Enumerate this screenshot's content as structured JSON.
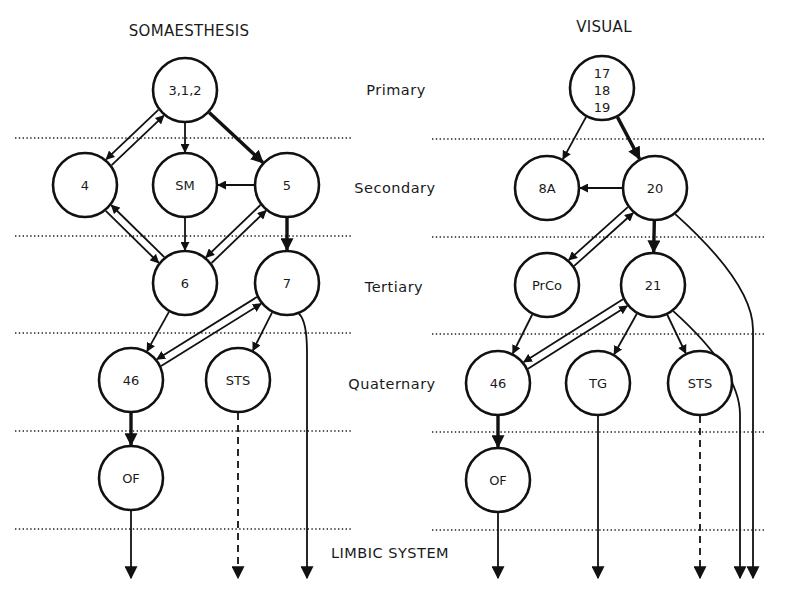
{
  "figure": {
    "levels": [
      {
        "id": "primary",
        "label": "Primary"
      },
      {
        "id": "secondary",
        "label": "Secondary"
      },
      {
        "id": "tertiary",
        "label": "Tertiary"
      },
      {
        "id": "quaternary",
        "label": "Quaternary"
      },
      {
        "id": "limbic",
        "label": "LIMBIC SYSTEM"
      }
    ],
    "panels": [
      {
        "id": "somaesthesis",
        "title": "SOMAESTHESIS",
        "nodes": [
          {
            "id": "s312",
            "label": "3,1,2",
            "level": "primary"
          },
          {
            "id": "s4",
            "label": "4",
            "level": "secondary"
          },
          {
            "id": "sSM",
            "label": "SM",
            "level": "secondary"
          },
          {
            "id": "s5",
            "label": "5",
            "level": "secondary"
          },
          {
            "id": "s6",
            "label": "6",
            "level": "tertiary"
          },
          {
            "id": "s7",
            "label": "7",
            "level": "tertiary"
          },
          {
            "id": "s46",
            "label": "46",
            "level": "quaternary"
          },
          {
            "id": "sSTS",
            "label": "STS",
            "level": "quaternary"
          },
          {
            "id": "sOF",
            "label": "OF",
            "level": "quaternary-limbic"
          }
        ],
        "edges": [
          {
            "from": "s312",
            "to": "s4",
            "type": "reciprocal"
          },
          {
            "from": "s312",
            "to": "sSM",
            "type": "normal"
          },
          {
            "from": "s312",
            "to": "s5",
            "type": "thick"
          },
          {
            "from": "s5",
            "to": "sSM",
            "type": "normal"
          },
          {
            "from": "s4",
            "to": "s6",
            "type": "reciprocal"
          },
          {
            "from": "sSM",
            "to": "s6",
            "type": "normal"
          },
          {
            "from": "s5",
            "to": "s6",
            "type": "reciprocal"
          },
          {
            "from": "s5",
            "to": "s7",
            "type": "thick"
          },
          {
            "from": "s6",
            "to": "s46",
            "type": "normal"
          },
          {
            "from": "s7",
            "to": "s46",
            "type": "reciprocal"
          },
          {
            "from": "s7",
            "to": "sSTS",
            "type": "normal"
          },
          {
            "from": "s46",
            "to": "sOF",
            "type": "thick"
          },
          {
            "from": "sOF",
            "to": "limbic",
            "type": "normal"
          },
          {
            "from": "sSTS",
            "to": "limbic",
            "type": "dashed"
          },
          {
            "from": "s7",
            "to": "limbic",
            "type": "normal"
          }
        ]
      },
      {
        "id": "visual",
        "title": "VISUAL",
        "nodes": [
          {
            "id": "v171819",
            "label": "17\n18\n19",
            "lines": [
              "17",
              "18",
              "19"
            ],
            "level": "primary"
          },
          {
            "id": "v8A",
            "label": "8A",
            "level": "secondary"
          },
          {
            "id": "v20",
            "label": "20",
            "level": "secondary"
          },
          {
            "id": "vPrCo",
            "label": "PrCo",
            "level": "tertiary"
          },
          {
            "id": "v21",
            "label": "21",
            "level": "tertiary"
          },
          {
            "id": "v46",
            "label": "46",
            "level": "quaternary"
          },
          {
            "id": "vTG",
            "label": "TG",
            "level": "quaternary"
          },
          {
            "id": "vSTS",
            "label": "STS",
            "level": "quaternary"
          },
          {
            "id": "vOF",
            "label": "OF",
            "level": "quaternary-limbic"
          }
        ],
        "edges": [
          {
            "from": "v171819",
            "to": "v8A",
            "type": "normal"
          },
          {
            "from": "v171819",
            "to": "v20",
            "type": "thick"
          },
          {
            "from": "v20",
            "to": "v8A",
            "type": "normal"
          },
          {
            "from": "v20",
            "to": "vPrCo",
            "type": "reciprocal"
          },
          {
            "from": "v20",
            "to": "v21",
            "type": "thick"
          },
          {
            "from": "vPrCo",
            "to": "v46",
            "type": "normal"
          },
          {
            "from": "v21",
            "to": "v46",
            "type": "reciprocal"
          },
          {
            "from": "v21",
            "to": "vTG",
            "type": "normal"
          },
          {
            "from": "v21",
            "to": "vSTS",
            "type": "normal"
          },
          {
            "from": "v46",
            "to": "vOF",
            "type": "thick"
          },
          {
            "from": "vOF",
            "to": "limbic",
            "type": "normal"
          },
          {
            "from": "vTG",
            "to": "limbic",
            "type": "normal"
          },
          {
            "from": "vSTS",
            "to": "limbic",
            "type": "dashed"
          },
          {
            "from": "v21",
            "to": "limbic",
            "type": "normal"
          },
          {
            "from": "v20",
            "to": "limbic",
            "type": "normal"
          }
        ]
      }
    ]
  }
}
